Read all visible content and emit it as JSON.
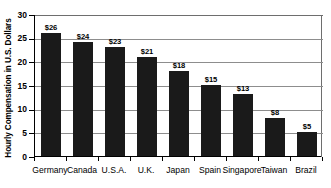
{
  "chart_data": {
    "type": "bar",
    "title": "",
    "subtitle": "",
    "xlabel": "",
    "ylabel": "Hourly Compensation in U.S. Dollars",
    "ylim": [
      0,
      30
    ],
    "ytick_labels": [
      "0",
      "5",
      "10",
      "15",
      "20",
      "25",
      "30"
    ],
    "ytick_values": [
      0,
      5,
      10,
      15,
      20,
      25,
      30
    ],
    "grid": "horizontal",
    "legend": "none",
    "bar_color": "#1a1a1a",
    "gridline_color": "#8d8d8d",
    "axis_color": "#000000",
    "categories": [
      "Germany",
      "Canada",
      "U.S.A.",
      "U.K.",
      "Japan",
      "Spain",
      "Singapore",
      "Taiwan",
      "Brazil"
    ],
    "values": [
      26,
      24,
      23,
      21,
      18,
      15,
      13,
      8,
      5
    ],
    "data_labels": [
      "$26",
      "$24",
      "$23",
      "$21",
      "$18",
      "$15",
      "$13",
      "$8",
      "$5"
    ]
  }
}
